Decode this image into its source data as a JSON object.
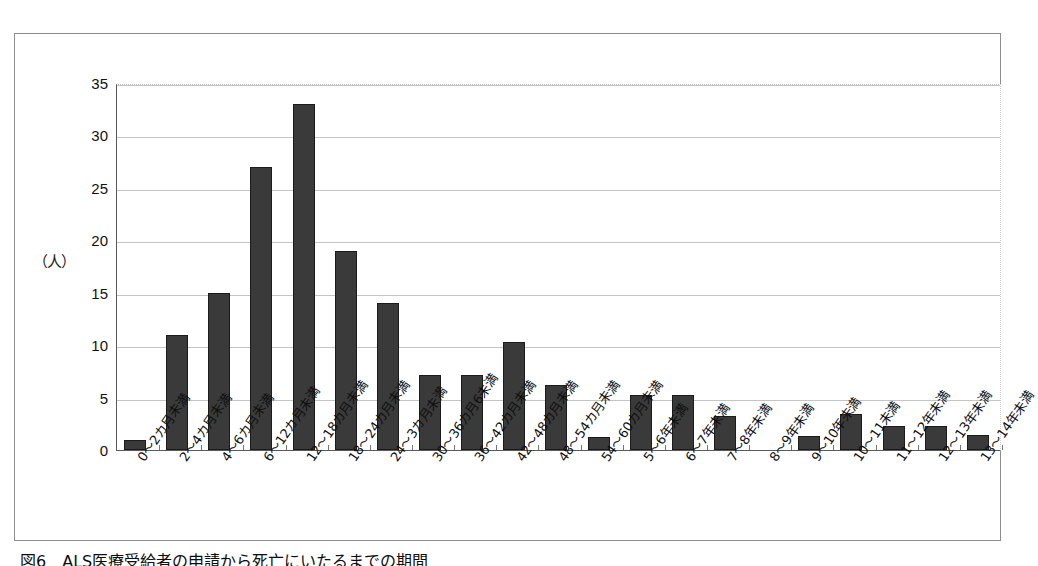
{
  "figure": {
    "caption": "図6　ALS医療受給者の申請から死亡にいたるまでの期間",
    "y_axis_unit": "（人）"
  },
  "chart_data": {
    "type": "bar",
    "title": "図6　ALS医療受給者の申請から死亡にいたるまでの期間",
    "xlabel": "",
    "ylabel": "（人）",
    "ylim": [
      0,
      35
    ],
    "yticks": [
      0,
      5,
      10,
      15,
      20,
      25,
      30,
      35
    ],
    "ytick_labels": [
      "0",
      "5",
      "10",
      "15",
      "20",
      "25",
      "30",
      "35"
    ],
    "grid": true,
    "legend": null,
    "bar_color": "#3a3a3a",
    "categories": [
      "0〜2カ月未満",
      "2〜4カ月未満",
      "4〜6カ月未満",
      "6〜12カ月未満",
      "12〜18カ月未満",
      "18〜24カ月未満",
      "24〜3カ月未満",
      "30〜36カ月6未満",
      "36〜42カ月未満",
      "42〜48カ月未満",
      "48〜54カ月未満",
      "54〜60カ月未満",
      "5〜6年未満",
      "6〜7年未満",
      "7〜8年未満",
      "8〜9年未満",
      "9〜10年未満",
      "10〜11未満",
      "11〜12年未満",
      "12〜13年未満",
      "13〜14年未満"
    ],
    "values": [
      1,
      11,
      15,
      27,
      33,
      19,
      14,
      7.2,
      7.2,
      10.3,
      6.2,
      1.2,
      5.2,
      5.2,
      3.2,
      0,
      1.3,
      3.4,
      2.3,
      2.3,
      1.4
    ]
  }
}
